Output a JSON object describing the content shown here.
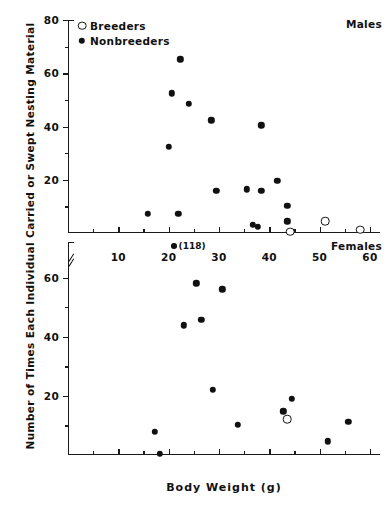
{
  "figure": {
    "ylabel": "Number of Times Each Individual Carried or Swept Nesting Material",
    "xlabel": "Body  Weight  (g)",
    "legend": [
      {
        "label": "Breeders",
        "marker": "open-circle"
      },
      {
        "label": "Nonbreeders",
        "marker": "filled-circle"
      }
    ],
    "panels": [
      {
        "tag": "Males"
      },
      {
        "tag": "Females"
      }
    ],
    "annotation": {
      "text": "(118)",
      "marker": "filled-circle"
    }
  },
  "chart_data": {
    "type": "scatter",
    "title": "",
    "xlabel": "Body Weight (g)",
    "ylabel": "Number of Times Each Individual Carried or Swept Nesting Material",
    "xlim": [
      0,
      62
    ],
    "ylim": [
      0,
      80
    ],
    "xticks": [
      10,
      20,
      30,
      40,
      50,
      60
    ],
    "xticks_minor": [
      5,
      15,
      25,
      35,
      45,
      55
    ],
    "grid": false,
    "legend_position": "top-left",
    "panels": [
      {
        "name": "Males",
        "ylim": [
          0,
          80
        ],
        "yticks": [
          20,
          40,
          60,
          80
        ],
        "yticks_minor": [
          10,
          30,
          50,
          70
        ],
        "series": [
          {
            "name": "Nonbreeders",
            "marker": "filled-circle",
            "points": [
              {
                "x": 15.8,
                "y": 7.3
              },
              {
                "x": 20.0,
                "y": 32.4
              },
              {
                "x": 20.6,
                "y": 52.4
              },
              {
                "x": 22.3,
                "y": 65.2
              },
              {
                "x": 24.0,
                "y": 48.5
              },
              {
                "x": 21.9,
                "y": 7.2
              },
              {
                "x": 28.5,
                "y": 42.3
              },
              {
                "x": 29.5,
                "y": 15.8
              },
              {
                "x": 35.5,
                "y": 16.4
              },
              {
                "x": 38.4,
                "y": 40.4
              },
              {
                "x": 38.4,
                "y": 15.8
              },
              {
                "x": 36.7,
                "y": 3.1
              },
              {
                "x": 37.7,
                "y": 2.4
              },
              {
                "x": 41.6,
                "y": 19.6
              },
              {
                "x": 43.6,
                "y": 10.2
              },
              {
                "x": 43.6,
                "y": 4.4
              }
            ]
          },
          {
            "name": "Breeders",
            "marker": "open-circle",
            "points": [
              {
                "x": 44.2,
                "y": 0.5
              },
              {
                "x": 51.1,
                "y": 4.4
              },
              {
                "x": 58.1,
                "y": 1.2
              }
            ]
          }
        ]
      },
      {
        "name": "Females",
        "ylim": [
          0,
          72
        ],
        "yticks": [
          20,
          40,
          60
        ],
        "yticks_minor": [
          10,
          30,
          50
        ],
        "axis_break": true,
        "series": [
          {
            "name": "Nonbreeders",
            "marker": "filled-circle",
            "points": [
              {
                "x": 17.3,
                "y": 7.8
              },
              {
                "x": 18.3,
                "y": 0.4
              },
              {
                "x": 23.0,
                "y": 43.8
              },
              {
                "x": 25.5,
                "y": 58.1
              },
              {
                "x": 26.5,
                "y": 45.7
              },
              {
                "x": 30.7,
                "y": 56.0
              },
              {
                "x": 28.8,
                "y": 22.1
              },
              {
                "x": 33.8,
                "y": 10.3
              },
              {
                "x": 42.8,
                "y": 14.8
              },
              {
                "x": 44.5,
                "y": 19.0
              },
              {
                "x": 51.6,
                "y": 4.6
              },
              {
                "x": 55.7,
                "y": 11.3
              }
            ]
          },
          {
            "name": "Breeders",
            "marker": "open-circle",
            "points": [
              {
                "x": 43.6,
                "y": 12.2
              }
            ]
          }
        ],
        "annotated_outlier": {
          "x": 22.0,
          "y": 118,
          "label": "(118)"
        }
      }
    ]
  }
}
